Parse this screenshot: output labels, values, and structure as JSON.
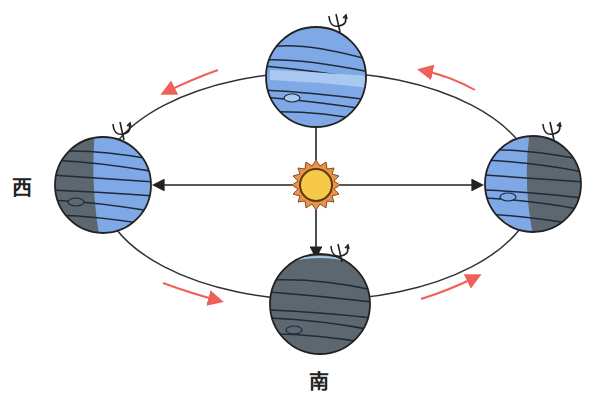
{
  "diagram": {
    "title": "",
    "labels": {
      "west": "西",
      "south": "南"
    },
    "center": {
      "name": "sun",
      "color": "#f7c948",
      "ray_color": "#e8924a"
    },
    "orbit": {
      "direction": "counter-clockwise",
      "arrow_color": "#f0605a"
    },
    "planets": [
      {
        "position": "top",
        "lit_side": "full-lit",
        "color_lit": "#7fa9e6",
        "color_dark": "#5c6770"
      },
      {
        "position": "left",
        "lit_side": "right-half-lit",
        "color_lit": "#7fa9e6",
        "color_dark": "#5c6770"
      },
      {
        "position": "right",
        "lit_side": "left-half-lit",
        "color_lit": "#7fa9e6",
        "color_dark": "#5c6770"
      },
      {
        "position": "bottom",
        "lit_side": "fully-dark",
        "color_lit": "#7fa9e6",
        "color_dark": "#5c6770"
      }
    ],
    "rotation_symbol": "spin-axis-icon"
  }
}
